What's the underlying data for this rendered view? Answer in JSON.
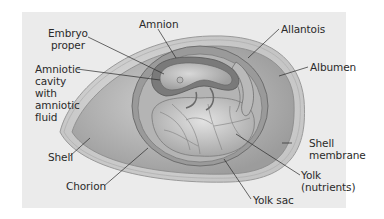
{
  "diagram": {
    "colors": {
      "background": "#ffffff",
      "panel": "#ebebeb",
      "shell": "#d6d6d6",
      "albumen": "#bdbdbd",
      "chorion_cavity": "#8f8f8f",
      "yolk": "#c9c9c9",
      "leader_line": "#2a2a2a"
    },
    "labels": [
      {
        "id": "amnion",
        "text": "Amnion"
      },
      {
        "id": "embryo",
        "text": "Embryo\nproper"
      },
      {
        "id": "amniotic_cavity",
        "text": "Amniotic\ncavity\nwith\namniotic\nfluid"
      },
      {
        "id": "allantois",
        "text": "Allantois"
      },
      {
        "id": "albumen",
        "text": "Albumen"
      },
      {
        "id": "shell",
        "text": "Shell"
      },
      {
        "id": "shell_membrane",
        "text": "Shell\nmembrane"
      },
      {
        "id": "yolk",
        "text": "Yolk\n(nutrients)"
      },
      {
        "id": "chorion",
        "text": "Chorion"
      },
      {
        "id": "yolk_sac",
        "text": "Yolk sac"
      }
    ]
  }
}
